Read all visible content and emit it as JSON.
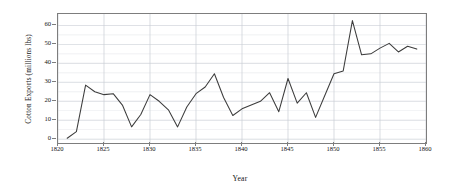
{
  "chart_data": {
    "type": "line",
    "title": "",
    "xlabel": "Year",
    "ylabel": "Cotton Exports (millions lbs)",
    "xlim": [
      1820,
      1860
    ],
    "ylim": [
      -2,
      66
    ],
    "xticks": [
      1820,
      1825,
      1830,
      1835,
      1840,
      1845,
      1850,
      1855,
      1860
    ],
    "yticks": [
      0,
      10,
      20,
      30,
      40,
      50,
      60
    ],
    "grid": true,
    "legend": null,
    "line_color": "#3c3c3c",
    "grid_color": "#c8cdd4",
    "axis_color": "#7d7d7d",
    "series": [
      {
        "name": "Cotton Exports",
        "x": [
          1821,
          1822,
          1823,
          1824,
          1825,
          1826,
          1827,
          1828,
          1829,
          1830,
          1831,
          1832,
          1833,
          1834,
          1835,
          1836,
          1837,
          1838,
          1839,
          1840,
          1841,
          1842,
          1843,
          1844,
          1845,
          1846,
          1847,
          1848,
          1849,
          1850,
          1851,
          1852,
          1853,
          1854,
          1855,
          1856,
          1857,
          1858,
          1859
        ],
        "values": [
          0.5,
          4.0,
          28.5,
          25.0,
          23.5,
          24.0,
          18.0,
          6.5,
          13.0,
          23.5,
          20.0,
          15.5,
          6.5,
          17.0,
          24.0,
          27.5,
          34.5,
          22.0,
          12.5,
          16.0,
          18.0,
          20.0,
          24.5,
          14.5,
          32.0,
          19.0,
          24.5,
          11.5,
          23.0,
          34.5,
          36.0,
          62.5,
          44.5,
          45.0,
          48.0,
          50.5,
          46.0,
          49.0,
          47.5
        ]
      }
    ]
  },
  "axes": {
    "ylabel": "Cotton Exports (millions lbs)",
    "xlabel": "Year",
    "ytick_labels": [
      "0",
      "10",
      "20",
      "30",
      "40",
      "50",
      "60"
    ],
    "xtick_labels": [
      "1820",
      "1825",
      "1830",
      "1835",
      "1840",
      "1845",
      "1850",
      "1855",
      "1860"
    ]
  }
}
